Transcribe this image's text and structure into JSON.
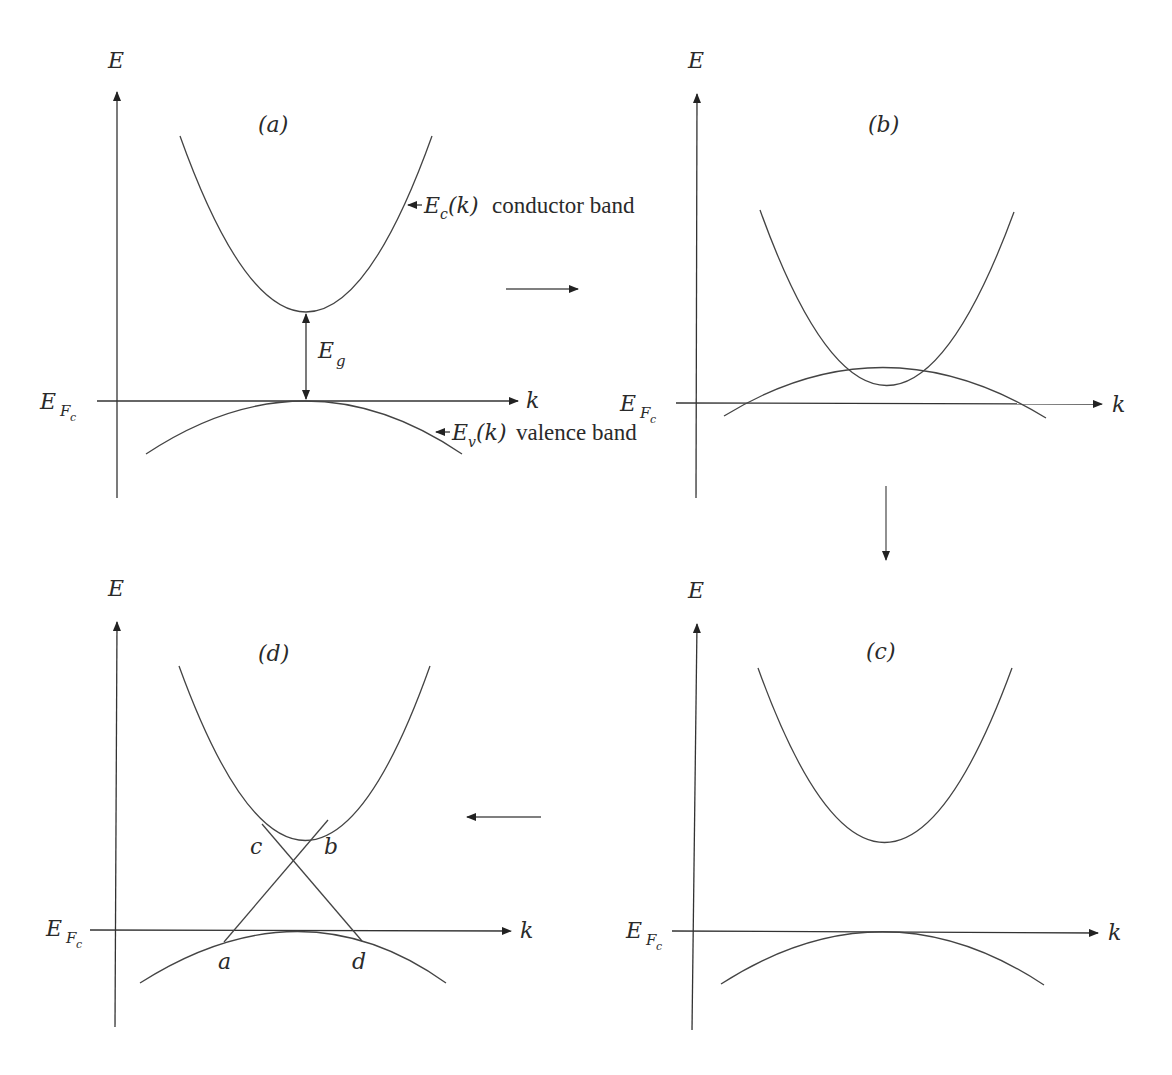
{
  "figure": {
    "type": "energy band diagram sequence",
    "colors": {
      "line": "#444444",
      "text": "#2a2a2a",
      "background": "#ffffff"
    },
    "panels": [
      {
        "id": "a",
        "label": "(a)",
        "axis_y_label": "E",
        "axis_x_label": "k",
        "fermi_label_main": "E",
        "fermi_label_sub": "F",
        "fermi_label_subsub": "c",
        "gap_label_main": "E",
        "gap_label_sub": "g",
        "conduction_annotation": {
          "main": "E",
          "sub": "c",
          "arg": "(k)",
          "text": "conductor band"
        },
        "valence_annotation": {
          "main": "E",
          "sub": "v",
          "arg": "(k)",
          "text": "valence band"
        }
      },
      {
        "id": "b",
        "label": "(b)",
        "axis_y_label": "E",
        "axis_x_label": "k",
        "fermi_label_main": "E",
        "fermi_label_sub": "F",
        "fermi_label_subsub": "c",
        "description": "bands overlap"
      },
      {
        "id": "c",
        "label": "(c)",
        "axis_y_label": "E",
        "axis_x_label": "k",
        "fermi_label_main": "E",
        "fermi_label_sub": "F",
        "fermi_label_subsub": "c",
        "description": "gap reopens"
      },
      {
        "id": "d",
        "label": "(d)",
        "axis_y_label": "E",
        "axis_x_label": "k",
        "fermi_label_main": "E",
        "fermi_label_sub": "F",
        "fermi_label_subsub": "c",
        "crossing_points": [
          "a",
          "b",
          "c",
          "d"
        ]
      }
    ],
    "flow_arrows": [
      {
        "from": "a",
        "to": "b",
        "direction": "right"
      },
      {
        "from": "b",
        "to": "c",
        "direction": "down"
      },
      {
        "from": "c",
        "to": "d",
        "direction": "left"
      }
    ]
  }
}
